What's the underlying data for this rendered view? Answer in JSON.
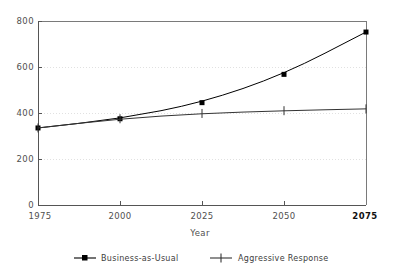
{
  "chart_data": {
    "type": "line",
    "title": "",
    "xlabel": "Year",
    "ylabel": "",
    "x": [
      1975,
      2000,
      2025,
      2050,
      2075
    ],
    "xtick_labels": [
      "1975",
      "2000",
      "2025",
      "2050",
      "2075"
    ],
    "ytick_labels": [
      "0",
      "200",
      "400",
      "600",
      "800"
    ],
    "yticks": [
      0,
      200,
      400,
      600,
      800
    ],
    "xlim": [
      1975,
      2075
    ],
    "ylim": [
      0,
      800
    ],
    "grid": true,
    "grid_axis": "y",
    "legend_position": "bottom",
    "series": [
      {
        "name": "Business-as-Usual",
        "marker": "square",
        "color": "#000000",
        "values": [
          335,
          375,
          445,
          568,
          752
        ]
      },
      {
        "name": "Aggressive Response",
        "marker": "plus",
        "color": "#333333",
        "values": [
          335,
          375,
          398,
          410,
          418
        ]
      }
    ]
  },
  "axes": {
    "x_title": "Year",
    "x_ticks": [
      "1975",
      "2000",
      "2025",
      "2050",
      "2075"
    ],
    "y_ticks": [
      "800",
      "600",
      "400",
      "200",
      "0"
    ]
  },
  "legend": {
    "items": [
      {
        "label": "Business-as-Usual",
        "marker": "square-marker"
      },
      {
        "label": "Aggressive Response",
        "marker": "plus-marker"
      }
    ]
  },
  "colors": {
    "series_primary": "#000000",
    "series_secondary": "#333333",
    "axis": "#555555",
    "grid": "#d9d9d9",
    "text": "#4f4f4f",
    "background": "#ffffff"
  }
}
